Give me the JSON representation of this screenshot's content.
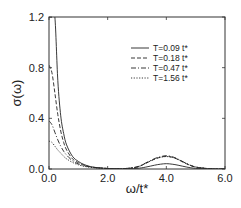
{
  "chart_data": {
    "type": "line",
    "title": "",
    "xlabel": "ω/t*",
    "ylabel": "σ(ω)",
    "xlim": [
      0,
      6
    ],
    "ylim": [
      0,
      1.2
    ],
    "xticks": [
      "0.0",
      "2.0",
      "4.0",
      "6.0"
    ],
    "xtick_values": [
      0,
      2,
      4,
      6
    ],
    "yticks": [
      "0.0",
      "0.4",
      "0.8",
      "1.2"
    ],
    "ytick_values": [
      0,
      0.4,
      0.8,
      1.2
    ],
    "grid": false,
    "legend_position": "top-right",
    "series": [
      {
        "name": "T=0.09 t*",
        "style": "solid",
        "x": [
          0.0,
          0.1,
          0.2,
          0.3,
          0.4,
          0.5,
          0.6,
          0.8,
          1.0,
          1.2,
          1.5,
          2.0,
          2.5,
          3.0,
          3.3,
          3.6,
          3.8,
          4.0,
          4.2,
          4.4,
          4.7,
          5.0,
          5.5,
          6.0
        ],
        "y": [
          1.2,
          1.2,
          1.2,
          0.7,
          0.42,
          0.28,
          0.19,
          0.1,
          0.06,
          0.035,
          0.015,
          0.004,
          0.001,
          0.005,
          0.015,
          0.03,
          0.038,
          0.042,
          0.038,
          0.03,
          0.015,
          0.005,
          0.001,
          0.0
        ]
      },
      {
        "name": "T=0.18 t*",
        "style": "dashed",
        "x": [
          0.0,
          0.1,
          0.2,
          0.3,
          0.4,
          0.5,
          0.6,
          0.8,
          1.0,
          1.2,
          1.5,
          2.0,
          2.5,
          3.0,
          3.3,
          3.6,
          3.8,
          4.0,
          4.2,
          4.4,
          4.7,
          5.0,
          5.5,
          6.0
        ],
        "y": [
          0.82,
          0.76,
          0.6,
          0.43,
          0.3,
          0.21,
          0.15,
          0.08,
          0.05,
          0.03,
          0.014,
          0.004,
          0.002,
          0.015,
          0.045,
          0.078,
          0.093,
          0.1,
          0.093,
          0.075,
          0.04,
          0.015,
          0.002,
          0.0
        ]
      },
      {
        "name": "T=0.47 t*",
        "style": "dashdot",
        "x": [
          0.0,
          0.1,
          0.2,
          0.3,
          0.4,
          0.5,
          0.6,
          0.8,
          1.0,
          1.2,
          1.5,
          2.0,
          2.5,
          3.0,
          3.3,
          3.6,
          3.8,
          4.0,
          4.2,
          4.4,
          4.7,
          5.0,
          5.5,
          6.0
        ],
        "y": [
          0.38,
          0.35,
          0.29,
          0.23,
          0.18,
          0.14,
          0.11,
          0.065,
          0.04,
          0.025,
          0.012,
          0.004,
          0.002,
          0.017,
          0.048,
          0.082,
          0.097,
          0.105,
          0.097,
          0.078,
          0.042,
          0.016,
          0.002,
          0.0
        ]
      },
      {
        "name": "T=1.56 t*",
        "style": "dotted",
        "x": [
          0.0,
          0.1,
          0.2,
          0.3,
          0.4,
          0.5,
          0.6,
          0.8,
          1.0,
          1.2,
          1.5,
          2.0,
          2.5,
          3.0,
          3.3,
          3.6,
          3.8,
          4.0,
          4.2,
          4.4,
          4.7,
          5.0,
          5.5,
          6.0
        ],
        "y": [
          0.22,
          0.21,
          0.18,
          0.15,
          0.125,
          0.1,
          0.08,
          0.052,
          0.033,
          0.021,
          0.011,
          0.004,
          0.002,
          0.016,
          0.046,
          0.078,
          0.092,
          0.098,
          0.092,
          0.075,
          0.041,
          0.016,
          0.002,
          0.0
        ]
      }
    ]
  }
}
